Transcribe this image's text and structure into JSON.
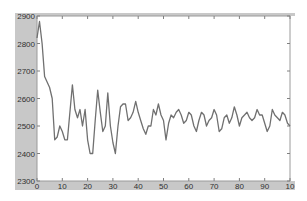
{
  "chart_data": {
    "type": "line",
    "title": "",
    "xlabel": "",
    "ylabel": "",
    "xlim": [
      0,
      100
    ],
    "ylim": [
      2300,
      2900
    ],
    "xticks": [
      0,
      10,
      20,
      30,
      40,
      50,
      60,
      70,
      80,
      90,
      100
    ],
    "yticks": [
      2300,
      2400,
      2500,
      2600,
      2700,
      2800,
      2900
    ],
    "xtick_labels": [
      "0",
      "10",
      "20",
      "30",
      "40",
      "50",
      "60",
      "70",
      "80",
      "90",
      "10"
    ],
    "ytick_labels": [
      "2300",
      "2400",
      "2500",
      "2600",
      "2700",
      "2800",
      "2900"
    ],
    "grid": false,
    "legend": null,
    "series": [
      {
        "name": "series-1",
        "color": "#707070",
        "x": [
          0,
          1,
          2,
          3,
          4,
          5,
          6,
          7,
          8,
          9,
          10,
          11,
          12,
          13,
          14,
          15,
          16,
          17,
          18,
          19,
          20,
          21,
          22,
          23,
          24,
          25,
          26,
          27,
          28,
          29,
          30,
          31,
          32,
          33,
          34,
          35,
          36,
          37,
          38,
          39,
          40,
          41,
          42,
          43,
          44,
          45,
          46,
          47,
          48,
          49,
          50,
          51,
          52,
          53,
          54,
          55,
          56,
          57,
          58,
          59,
          60,
          61,
          62,
          63,
          64,
          65,
          66,
          67,
          68,
          69,
          70,
          71,
          72,
          73,
          74,
          75,
          76,
          77,
          78,
          79,
          80,
          81,
          82,
          83,
          84,
          85,
          86,
          87,
          88,
          89,
          90,
          91,
          92,
          93,
          94,
          95,
          96,
          97,
          98,
          99,
          100
        ],
        "values": [
          2820,
          2880,
          2800,
          2680,
          2660,
          2640,
          2600,
          2450,
          2460,
          2500,
          2480,
          2450,
          2450,
          2550,
          2650,
          2560,
          2530,
          2560,
          2500,
          2560,
          2450,
          2400,
          2400,
          2520,
          2630,
          2550,
          2480,
          2500,
          2620,
          2500,
          2440,
          2400,
          2500,
          2570,
          2580,
          2580,
          2520,
          2530,
          2550,
          2590,
          2550,
          2520,
          2490,
          2470,
          2500,
          2500,
          2560,
          2540,
          2580,
          2540,
          2520,
          2450,
          2510,
          2540,
          2530,
          2550,
          2560,
          2540,
          2510,
          2520,
          2550,
          2540,
          2500,
          2480,
          2520,
          2550,
          2540,
          2500,
          2520,
          2530,
          2560,
          2540,
          2480,
          2490,
          2530,
          2540,
          2510,
          2530,
          2570,
          2540,
          2500,
          2530,
          2540,
          2550,
          2530,
          2520,
          2530,
          2560,
          2540,
          2540,
          2510,
          2480,
          2500,
          2560,
          2540,
          2530,
          2520,
          2550,
          2540,
          2510,
          2500
        ]
      }
    ]
  },
  "axes": {
    "background": "#ffffff",
    "frame_color": "#c8c8c8",
    "axis_color": "#808080"
  }
}
